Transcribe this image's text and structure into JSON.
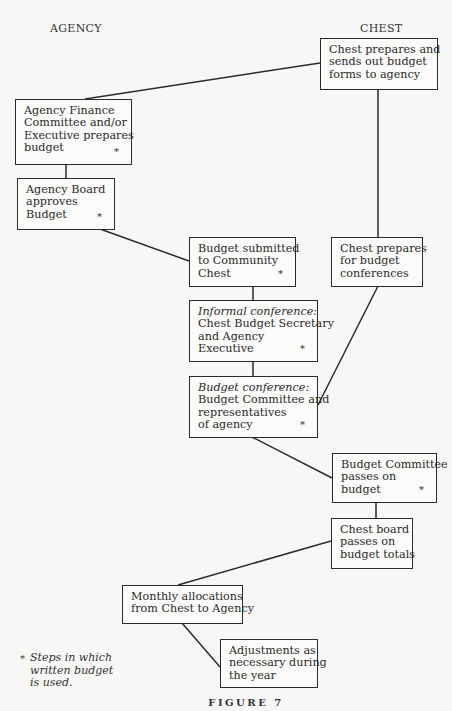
{
  "columns": {
    "agency": "AGENCY",
    "chest": "CHEST"
  },
  "boxes": {
    "chest_sends_forms": {
      "lines": [
        "Chest prepares and",
        "sends out budget",
        "forms to agency"
      ],
      "starred": false
    },
    "agency_finance": {
      "lines": [
        "Agency Finance",
        "Committee and/or",
        "Executive prepares",
        "budget"
      ],
      "starred": true
    },
    "agency_board": {
      "lines": [
        "Agency Board",
        "approves",
        "Budget"
      ],
      "starred": true
    },
    "budget_submitted": {
      "lines": [
        "Budget submitted",
        "to Community",
        "Chest"
      ],
      "starred": true
    },
    "chest_prepares_conferences": {
      "lines": [
        "Chest prepares",
        "for budget",
        "conferences"
      ],
      "starred": false
    },
    "informal_conference": {
      "heading": "Informal conference:",
      "lines": [
        "Chest Budget Secretary",
        "and Agency",
        "Executive"
      ],
      "starred": true
    },
    "budget_conference": {
      "heading": "Budget conference:",
      "lines": [
        "Budget Committee and",
        "representatives",
        "of agency"
      ],
      "starred": true
    },
    "budget_committee_passes": {
      "lines": [
        "Budget Committee",
        "passes on",
        "budget"
      ],
      "starred": true
    },
    "chest_board_passes": {
      "lines": [
        "Chest board",
        "passes on",
        "budget totals"
      ],
      "starred": false
    },
    "monthly_allocations": {
      "lines": [
        "Monthly allocations",
        "from Chest to Agency"
      ],
      "starred": false
    },
    "adjustments": {
      "lines": [
        "Adjustments as",
        "necessary during",
        "the year"
      ],
      "starred": false
    }
  },
  "star_symbol": "*",
  "footnote": {
    "symbol": "*",
    "lines": [
      "Steps in which",
      "written budget",
      "is used."
    ]
  },
  "caption": "FIGURE 7",
  "connections": [
    {
      "from": "chest_sends_forms",
      "to": "agency_finance"
    },
    {
      "from": "chest_sends_forms",
      "to": "chest_prepares_conferences"
    },
    {
      "from": "agency_finance",
      "to": "agency_board"
    },
    {
      "from": "agency_board",
      "to": "budget_submitted"
    },
    {
      "from": "budget_submitted",
      "to": "informal_conference"
    },
    {
      "from": "informal_conference",
      "to": "budget_conference"
    },
    {
      "from": "chest_prepares_conferences",
      "to": "budget_conference"
    },
    {
      "from": "budget_conference",
      "to": "budget_committee_passes"
    },
    {
      "from": "budget_committee_passes",
      "to": "chest_board_passes"
    },
    {
      "from": "chest_board_passes",
      "to": "monthly_allocations"
    },
    {
      "from": "monthly_allocations",
      "to": "adjustments"
    }
  ]
}
